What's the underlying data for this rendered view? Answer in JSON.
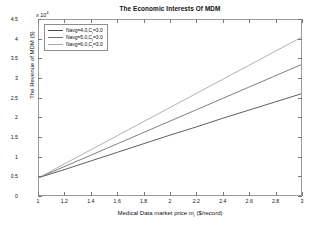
{
  "chart_data": {
    "type": "line",
    "title": "The Economic Interests Of MDM",
    "xlabel_main": "Medical Data market price m",
    "xlabel_sub": "i",
    "xlabel_tail": " ($/record)",
    "ylabel": "The Revenue of MDM ($)",
    "y_exponent_prefix": "x 10",
    "y_exponent_power": "4",
    "y_scale_factor": 10000,
    "xlim": [
      1,
      3
    ],
    "ylim": [
      0,
      4.5
    ],
    "xticks": [
      "1",
      "1.2",
      "1.4",
      "1.6",
      "1.8",
      "2",
      "2.2",
      "2.4",
      "2.6",
      "2.8",
      "3"
    ],
    "xtick_values": [
      1,
      1.2,
      1.4,
      1.6,
      1.8,
      2,
      2.2,
      2.4,
      2.6,
      2.8,
      3
    ],
    "yticks": [
      "0",
      "0.5",
      "1",
      "1.5",
      "2",
      "2.5",
      "3",
      "3.5",
      "4",
      "4.5"
    ],
    "ytick_values": [
      0,
      0.5,
      1,
      1.5,
      2,
      2.5,
      3,
      3.5,
      4,
      4.5
    ],
    "grid": false,
    "legend_position": "top-left",
    "x": [
      1,
      1.2,
      1.4,
      1.6,
      1.8,
      2,
      2.2,
      2.4,
      2.6,
      2.8,
      3
    ],
    "series": [
      {
        "name": "Navg=4.0,C_i=3.0",
        "label_main": "Navg=4.0,C",
        "label_sub": "i",
        "label_tail": "=3.0",
        "color": "#4a4a4a",
        "values": [
          0.45,
          0.66,
          0.88,
          1.1,
          1.32,
          1.54,
          1.75,
          1.97,
          2.18,
          2.39,
          2.6
        ]
      },
      {
        "name": "Navg=5.0,C_i=3.0",
        "label_main": "Navg=5.0,C",
        "label_sub": "i",
        "label_tail": "=3.0",
        "color": "#6f6f6f",
        "values": [
          0.45,
          0.74,
          1.03,
          1.32,
          1.61,
          1.9,
          2.19,
          2.48,
          2.77,
          3.06,
          3.35
        ]
      },
      {
        "name": "Navg=6.0,C_i=3.0",
        "label_main": "Navg=6.0,C",
        "label_sub": "i",
        "label_tail": "=3.0",
        "color": "#a8a8a8",
        "values": [
          0.45,
          0.81,
          1.17,
          1.53,
          1.89,
          2.25,
          2.61,
          2.97,
          3.33,
          3.69,
          4.05
        ]
      }
    ]
  }
}
